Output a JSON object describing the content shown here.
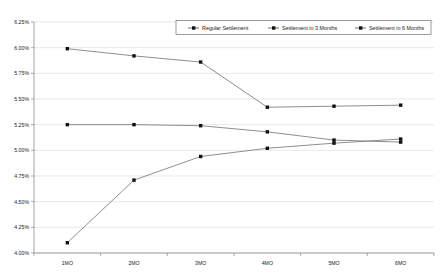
{
  "chart_data": {
    "type": "line",
    "title": "",
    "xlabel": "",
    "ylabel": "",
    "categories": [
      "1MO",
      "2MO",
      "3MO",
      "4MO",
      "5MO",
      "6MO"
    ],
    "ylim": [
      4.0,
      6.25
    ],
    "ytick_values": [
      4.0,
      4.25,
      4.5,
      4.75,
      5.0,
      5.25,
      5.5,
      5.75,
      6.0,
      6.25
    ],
    "ytick_labels": [
      "4.00%",
      "4.25%",
      "4.50%",
      "4.75%",
      "5.00%",
      "5.25%",
      "5.50%",
      "5.75%",
      "6.00%",
      "6.25%"
    ],
    "grid": true,
    "legend_position": "top-right",
    "value_format": "percent",
    "series": [
      {
        "name": "Regular Settlement",
        "marker": "square",
        "values": [
          5.99,
          5.92,
          5.86,
          5.42,
          5.43,
          5.44
        ]
      },
      {
        "name": "Settlement in 3 Months",
        "marker": "square",
        "values": [
          5.25,
          5.25,
          5.24,
          5.18,
          5.1,
          5.08
        ]
      },
      {
        "name": "Settlement in 6 Months",
        "marker": "square",
        "values": [
          4.1,
          4.71,
          4.94,
          5.02,
          5.07,
          5.11
        ]
      }
    ]
  },
  "axis": {
    "y_labels": [
      "6.25%",
      "6.00%",
      "5.75%",
      "5.50%",
      "5.25%",
      "5.00%",
      "4.75%",
      "4.50%",
      "4.25%",
      "4.00%"
    ],
    "x_labels": [
      "1MO",
      "2MO",
      "3MO",
      "4MO",
      "5MO",
      "6MO"
    ]
  },
  "legend": {
    "entries": [
      {
        "label": "Regular Settlement"
      },
      {
        "label": "Settlement in 3 Months"
      },
      {
        "label": "Settlement in 6 Months"
      }
    ]
  }
}
